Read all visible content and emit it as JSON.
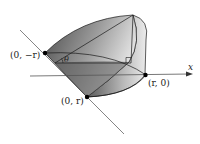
{
  "diagram": {
    "labels": {
      "point_neg_r": "(0, −r)",
      "point_pos_r": "(0, r)",
      "point_r0": "(r, 0)",
      "axis_x": "x",
      "angle": "θ"
    },
    "colors": {
      "solid_dark": "#3a3a3a",
      "solid_light": "#d8d8d8",
      "edge": "#1a1a1a",
      "axis": "#555555"
    }
  }
}
